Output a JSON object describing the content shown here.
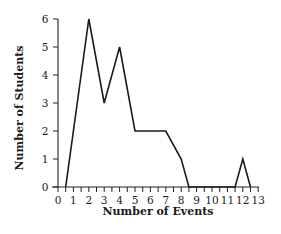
{
  "chart_data": {
    "type": "line",
    "title": "",
    "xlabel": "Number of Events",
    "ylabel": "Number of Students",
    "xlim": [
      0,
      13
    ],
    "ylim": [
      0,
      6
    ],
    "grid": false,
    "legend": null,
    "x_ticks": [
      "0",
      "1",
      "2",
      "3",
      "4",
      "5",
      "6",
      "7",
      "8",
      "9",
      "10",
      "11",
      "12",
      "13"
    ],
    "y_ticks": [
      "0",
      "1",
      "2",
      "3",
      "4",
      "5",
      "6"
    ],
    "x_minor_tick_step": 0.5,
    "series": [
      {
        "name": "Students",
        "x": [
          0.5,
          2,
          3,
          4,
          5,
          7,
          8,
          8.5,
          11.5,
          12,
          12.5
        ],
        "y": [
          0,
          6,
          3,
          5,
          2,
          2,
          1,
          0,
          0,
          1,
          0
        ]
      }
    ]
  }
}
